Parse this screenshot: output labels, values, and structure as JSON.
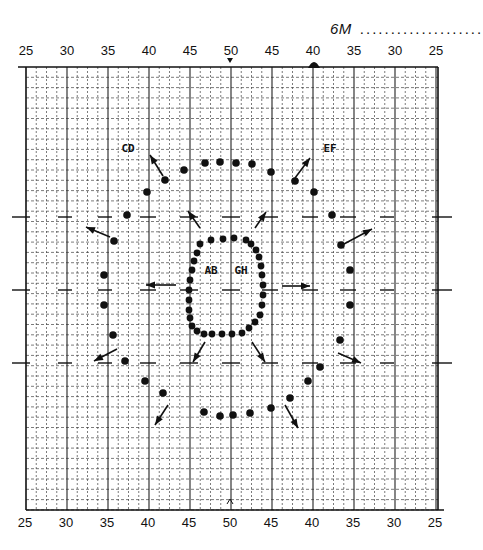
{
  "header": {
    "title": "6M",
    "dots": "...................."
  },
  "chart_data": {
    "type": "scatter",
    "title": "6M",
    "x_ticks_top": [
      "25",
      "30",
      "35",
      "40",
      "45",
      "50",
      "45",
      "40",
      "35",
      "30",
      "25"
    ],
    "x_ticks_bottom": [
      "25",
      "30",
      "35",
      "40",
      "45",
      "50",
      "45",
      "40",
      "35",
      "30",
      "25"
    ],
    "x_center_marker": "50",
    "grid": true,
    "region_labels": [
      {
        "text": "CD",
        "x": 128,
        "y": 148
      },
      {
        "text": "EF",
        "x": 330,
        "y": 148
      },
      {
        "text": "AB",
        "x": 211,
        "y": 270
      },
      {
        "text": "GH",
        "x": 241,
        "y": 270
      }
    ],
    "series": [
      {
        "name": "inner-ring",
        "points": [
          [
            211,
            240
          ],
          [
            223,
            239
          ],
          [
            234,
            238
          ],
          [
            246,
            240
          ],
          [
            200,
            244
          ],
          [
            197,
            253
          ],
          [
            194,
            261
          ],
          [
            192,
            270
          ],
          [
            190,
            280
          ],
          [
            189,
            290
          ],
          [
            189,
            300
          ],
          [
            189,
            310
          ],
          [
            190,
            318
          ],
          [
            192,
            326
          ],
          [
            197,
            331
          ],
          [
            204,
            334
          ],
          [
            212,
            334
          ],
          [
            222,
            334
          ],
          [
            232,
            334
          ],
          [
            242,
            333
          ],
          [
            249,
            328
          ],
          [
            255,
            322
          ],
          [
            260,
            315
          ],
          [
            262,
            305
          ],
          [
            263,
            295
          ],
          [
            263,
            285
          ],
          [
            262,
            275
          ],
          [
            261,
            266
          ],
          [
            259,
            257
          ],
          [
            256,
            250
          ],
          [
            251,
            244
          ]
        ]
      },
      {
        "name": "outer-ring",
        "points": [
          [
            205,
            163
          ],
          [
            220,
            162
          ],
          [
            236,
            163
          ],
          [
            252,
            164
          ],
          [
            184,
            170
          ],
          [
            165,
            180
          ],
          [
            147,
            192
          ],
          [
            127,
            215
          ],
          [
            114,
            241
          ],
          [
            104,
            275
          ],
          [
            104,
            305
          ],
          [
            113,
            335
          ],
          [
            125,
            361
          ],
          [
            145,
            381
          ],
          [
            163,
            393
          ],
          [
            204,
            412
          ],
          [
            220,
            416
          ],
          [
            233,
            415
          ],
          [
            250,
            413
          ],
          [
            271,
            408
          ],
          [
            290,
            398
          ],
          [
            308,
            381
          ],
          [
            320,
            367
          ],
          [
            340,
            340
          ],
          [
            350,
            305
          ],
          [
            350,
            270
          ],
          [
            341,
            245
          ],
          [
            332,
            215
          ],
          [
            314,
            192
          ],
          [
            295,
            181
          ],
          [
            271,
            172
          ]
        ]
      }
    ],
    "arrows": [
      {
        "from": [
          163,
          176
        ],
        "to": [
          150,
          155
        ],
        "label": "toward CD"
      },
      {
        "from": [
          295,
          178
        ],
        "to": [
          310,
          158
        ],
        "label": "toward EF"
      },
      {
        "from": [
          110,
          237
        ],
        "to": [
          86,
          227
        ]
      },
      {
        "from": [
          344,
          244
        ],
        "to": [
          372,
          229
        ]
      },
      {
        "from": [
          200,
          228
        ],
        "to": [
          188,
          211
        ]
      },
      {
        "from": [
          255,
          228
        ],
        "to": [
          266,
          212
        ]
      },
      {
        "from": [
          176,
          285
        ],
        "to": [
          146,
          285
        ]
      },
      {
        "from": [
          282,
          286
        ],
        "to": [
          310,
          286
        ]
      },
      {
        "from": [
          205,
          342
        ],
        "to": [
          193,
          362
        ]
      },
      {
        "from": [
          252,
          342
        ],
        "to": [
          265,
          362
        ]
      },
      {
        "from": [
          117,
          349
        ],
        "to": [
          94,
          361
        ]
      },
      {
        "from": [
          338,
          353
        ],
        "to": [
          361,
          363
        ]
      },
      {
        "from": [
          168,
          405
        ],
        "to": [
          155,
          425
        ]
      },
      {
        "from": [
          285,
          405
        ],
        "to": [
          298,
          428
        ]
      }
    ],
    "annotations": [
      {
        "type": "filled-marker",
        "x": 314,
        "y": 64,
        "note": "dark marker on top axis near 40 (right side)"
      }
    ],
    "xlim": [
      25,
      25
    ],
    "legend": "none"
  }
}
